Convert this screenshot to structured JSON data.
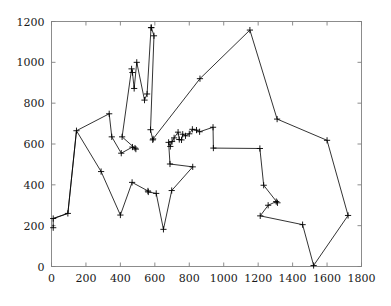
{
  "chart_data": {
    "type": "line",
    "title": "",
    "subtitle": "",
    "xlabel": "",
    "ylabel": "",
    "xlim": [
      0,
      1800
    ],
    "ylim": [
      0,
      1200
    ],
    "xticks": [
      0,
      200,
      400,
      600,
      800,
      1000,
      1200,
      1400,
      1600,
      1800
    ],
    "yticks": [
      0,
      200,
      400,
      600,
      800,
      1000,
      1200
    ],
    "xtick_labels": [
      "0",
      "200",
      "400",
      "600",
      "800",
      "1000",
      "1200",
      "1400",
      "1600",
      "1800"
    ],
    "ytick_labels": [
      "0",
      "200",
      "400",
      "600",
      "800",
      "1000",
      "1200"
    ],
    "grid": false,
    "legend": false,
    "legend_position": "none",
    "marker": "plus",
    "line_color": "#000000",
    "marker_color": "#000000",
    "frame_color": "#808080",
    "closed_tour": true,
    "series": [
      {
        "name": "tour",
        "points": [
          [
            10,
            190
          ],
          [
            10,
            235
          ],
          [
            95,
            260
          ],
          [
            145,
            665
          ],
          [
            335,
            748
          ],
          [
            350,
            635
          ],
          [
            405,
            555
          ],
          [
            470,
            585
          ],
          [
            485,
            580
          ],
          [
            490,
            575
          ],
          [
            410,
            635
          ],
          [
            465,
            968
          ],
          [
            470,
            950
          ],
          [
            480,
            872
          ],
          [
            495,
            1000
          ],
          [
            540,
            815
          ],
          [
            555,
            845
          ],
          [
            578,
            1170
          ],
          [
            580,
            1170
          ],
          [
            595,
            1130
          ],
          [
            575,
            670
          ],
          [
            588,
            620
          ],
          [
            590,
            625
          ],
          [
            862,
            920
          ],
          [
            1152,
            1158
          ],
          [
            1310,
            722
          ],
          [
            1600,
            618
          ],
          [
            1722,
            250
          ],
          [
            1522,
            5
          ],
          [
            1458,
            205
          ],
          [
            1212,
            248
          ],
          [
            1258,
            300
          ],
          [
            1305,
            318
          ],
          [
            1312,
            312
          ],
          [
            1232,
            398
          ],
          [
            1210,
            578
          ],
          [
            940,
            580
          ],
          [
            938,
            682
          ],
          [
            860,
            660
          ],
          [
            842,
            668
          ],
          [
            818,
            672
          ],
          [
            800,
            650
          ],
          [
            778,
            640
          ],
          [
            762,
            648
          ],
          [
            755,
            620
          ],
          [
            742,
            622
          ],
          [
            735,
            658
          ],
          [
            712,
            630
          ],
          [
            700,
            612
          ],
          [
            690,
            588
          ],
          [
            680,
            608
          ],
          [
            688,
            502
          ],
          [
            820,
            488
          ],
          [
            698,
            372
          ],
          [
            650,
            182
          ],
          [
            608,
            358
          ],
          [
            562,
            365
          ],
          [
            560,
            370
          ],
          [
            468,
            412
          ],
          [
            400,
            252
          ],
          [
            288,
            465
          ],
          [
            145,
            665
          ],
          [
            95,
            260
          ],
          [
            10,
            235
          ]
        ]
      }
    ],
    "note": "Closed tour path connecting all plotted nodes"
  },
  "axes": {
    "x_axis_name": "x-axis",
    "y_axis_name": "y-axis"
  }
}
